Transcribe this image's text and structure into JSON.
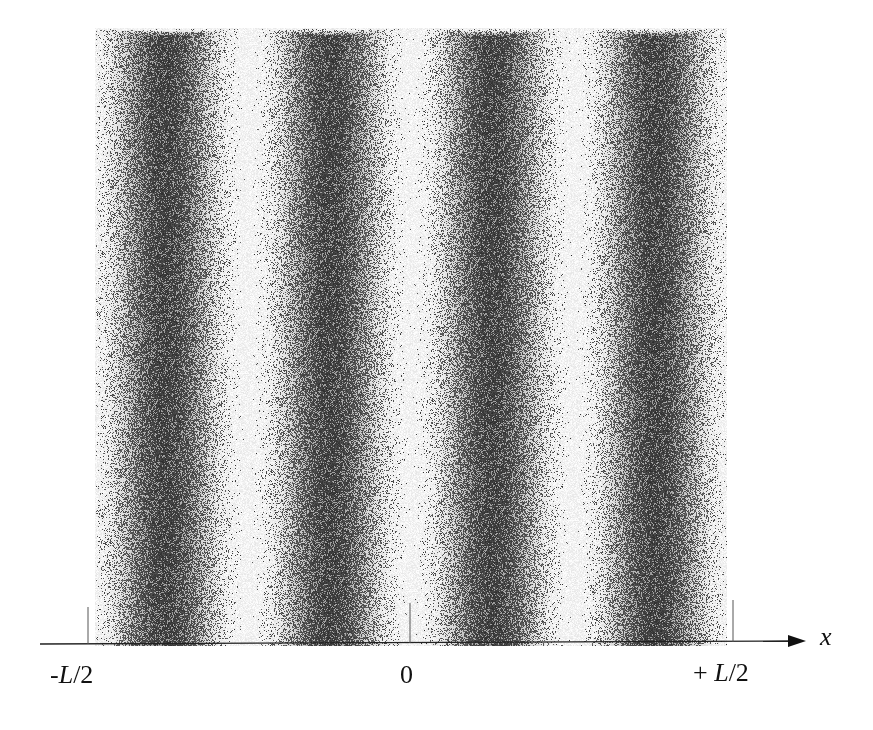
{
  "figure": {
    "fringes": {
      "dark_band_count": 4,
      "dark_band_centers_px": [
        165,
        330,
        492,
        655
      ],
      "period_px": 163,
      "dark_color": "#3a3a3a",
      "bright_color": "#ffffff"
    },
    "axis": {
      "label": "x",
      "ticks": [
        {
          "label_prefix": "-",
          "label_var": "L",
          "label_suffix": "/2",
          "x_px": 88
        },
        {
          "label_prefix": "",
          "label_var": "",
          "label_suffix": "0",
          "x_px": 410
        },
        {
          "label_prefix": "+ ",
          "label_var": "L",
          "label_suffix": "/2",
          "x_px": 733
        }
      ]
    }
  }
}
